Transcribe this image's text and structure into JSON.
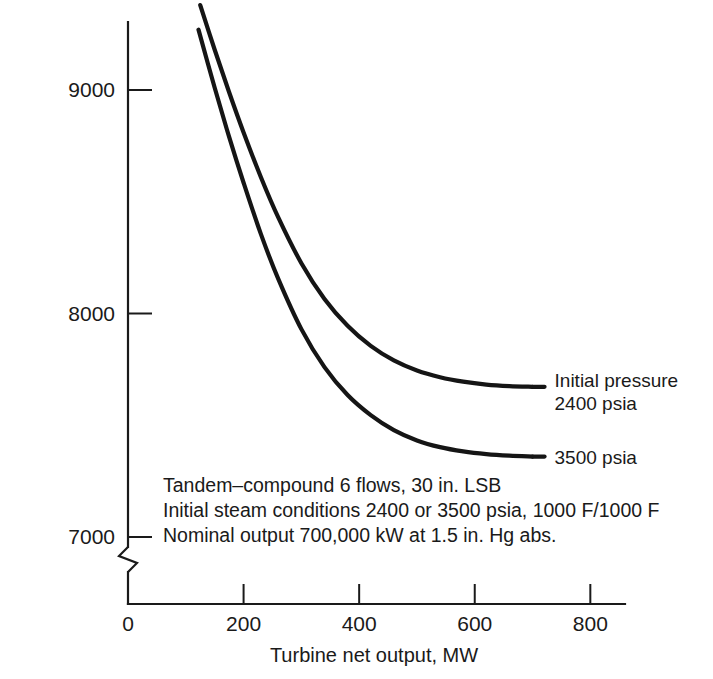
{
  "chart_data": {
    "type": "line",
    "title": "",
    "xlabel": "Turbine net output, MW",
    "ylabel": "Turbine net heat rate, Btu/kWh",
    "xlim": [
      0,
      860
    ],
    "ylim": [
      6820,
      9450
    ],
    "xticks": [
      0,
      200,
      400,
      600,
      800
    ],
    "xtick_labels": [
      "0",
      "200",
      "400",
      "600",
      "800"
    ],
    "yticks": [
      7000,
      8000,
      9000
    ],
    "ytick_labels": [
      "7000",
      "8000",
      "9000"
    ],
    "grid": false,
    "y_axis_break": true,
    "y_axis_break_below": 7000,
    "legend_position": "inline-right-of-curve-ends",
    "series": [
      {
        "name": "Initial pressure 2400 psia",
        "label_lines": [
          "Initial pressure",
          "2400 psia"
        ],
        "x": [
          125,
          150,
          175,
          200,
          230,
          260,
          300,
          340,
          380,
          420,
          460,
          500,
          540,
          580,
          620,
          660,
          700
        ],
        "y": [
          9380,
          9180,
          8990,
          8810,
          8610,
          8430,
          8225,
          8065,
          7945,
          7855,
          7790,
          7745,
          7715,
          7695,
          7682,
          7675,
          7672
        ]
      },
      {
        "name": "3500 psia",
        "label_lines": [
          "3500 psia"
        ],
        "x": [
          122,
          150,
          175,
          200,
          230,
          260,
          300,
          340,
          380,
          420,
          460,
          500,
          540,
          580,
          620,
          660,
          700
        ],
        "y": [
          9270,
          9010,
          8790,
          8585,
          8355,
          8155,
          7930,
          7760,
          7635,
          7545,
          7478,
          7432,
          7402,
          7383,
          7371,
          7364,
          7360
        ]
      }
    ],
    "annotations": [
      "Tandem–compound 6 flows, 30 in. LSB",
      "Initial steam conditions 2400 or 3500 psia, 1000 F/1000 F",
      "Nominal output 700,000 kW at 1.5 in. Hg abs."
    ],
    "colors": {
      "curve": "#151515",
      "axis": "#1a1a1a",
      "background": "#ffffff"
    }
  }
}
